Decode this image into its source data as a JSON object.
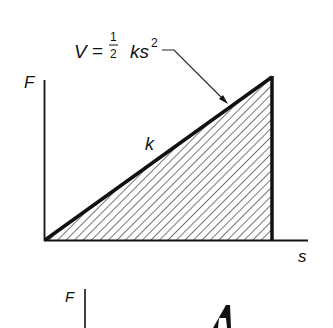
{
  "diagram": {
    "type": "force-displacement spring energy diagram",
    "top_figure": {
      "y_axis_label": "F",
      "x_axis_label": "s",
      "slope_label": "k",
      "formula": {
        "lhs": "V",
        "equals": "=",
        "fraction_numerator": "1",
        "fraction_denominator": "2",
        "term": "ks",
        "exponent": "2"
      },
      "fill": "hatched triangle (area under line)",
      "line_color": "#111111",
      "hatch_color": "#555555"
    },
    "bottom_figure": {
      "y_axis_label": "F",
      "partial": true
    }
  }
}
